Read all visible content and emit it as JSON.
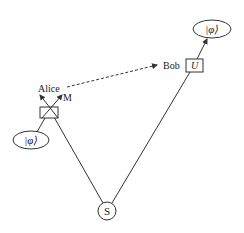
{
  "diagram": {
    "type": "quantum-teleportation",
    "source": {
      "label": "S"
    },
    "alice": {
      "label": "Alice",
      "measurement_label": "M"
    },
    "bob": {
      "label": "Bob",
      "operation_label": "U"
    },
    "input_state": {
      "label": "|φ⟩"
    },
    "output_state": {
      "label": "|φ⟩"
    },
    "classical_channel": {
      "style": "dashed",
      "from": "Alice",
      "to": "Bob"
    },
    "colors": {
      "stroke": "#333333",
      "background": "#ffffff"
    }
  }
}
